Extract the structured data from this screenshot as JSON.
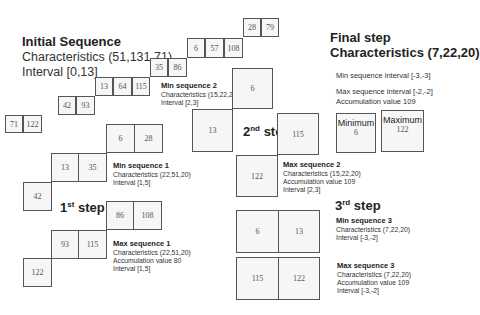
{
  "initial": {
    "title": "Initial Sequence",
    "characteristics": "Characteristics (51,131,71)",
    "interval": "Interval [0,13]",
    "staircase": [
      "71",
      "122",
      "42",
      "93",
      "13",
      "64",
      "115",
      "35",
      "86",
      "6",
      "57",
      "108",
      "28",
      "79"
    ]
  },
  "step1": {
    "label": "1",
    "label_sup": "st",
    "label_rest": " step",
    "min_boxes": [
      "6",
      "28",
      "13",
      "35",
      "42"
    ],
    "max_boxes": [
      "86",
      "108",
      "93",
      "115",
      "122"
    ],
    "min_seq": {
      "title": "Min sequence 1",
      "characteristics": "Characteristics (22,51,20)",
      "interval": "Interval [1,5]"
    },
    "max_seq": {
      "title": "Max sequence 1",
      "characteristics": "Characteristics (22,51,20)",
      "accumulation": "Accumulation value 80",
      "interval": "Interval [1,5]"
    }
  },
  "step2": {
    "label": "2",
    "label_sup": "nd",
    "label_rest": " step",
    "min_boxes": [
      "6",
      "13"
    ],
    "max_boxes": [
      "115",
      "122"
    ],
    "min_seq": {
      "title": "Min sequence 2",
      "characteristics": "Characteristics (15,22,20)",
      "interval": "Interval [2,3]"
    },
    "max_seq": {
      "title": "Max sequence 2",
      "characteristics": "Characteristics (15,22,20)",
      "accumulation": "Accumulation value 109",
      "interval": "Interval [2,3]"
    }
  },
  "step3": {
    "label": "3",
    "label_sup": "rd",
    "label_rest": " step",
    "min_boxes": [
      "6",
      "13"
    ],
    "max_boxes": [
      "115",
      "122"
    ],
    "min_seq": {
      "title": "Min sequence 3",
      "characteristics": "Characteristics (7,22,20)",
      "interval": "Interval [-3,-2]"
    },
    "max_seq": {
      "title": "Max sequence 3",
      "characteristics": "Characteristics (7,22,20)",
      "accumulation": "Accumulation value 109",
      "interval": "Interval [-3,-2]"
    }
  },
  "final": {
    "title": "Final step",
    "characteristics": "Characteristics (7,22,20)",
    "min_interval": "Min sequence interval [-3,-3]",
    "max_interval": "Max sequence interval [-2,-2]",
    "accumulation": "Accumulation value 109",
    "minimum_label": "Minimum",
    "minimum_value": "6",
    "maximum_label": "Maximum",
    "maximum_value": "122"
  }
}
